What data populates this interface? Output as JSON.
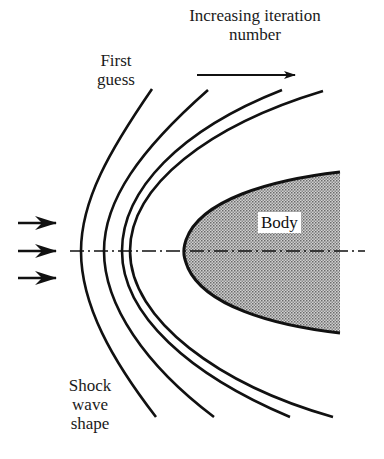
{
  "figure": {
    "labels": {
      "iteration_line1": "Increasing iteration",
      "iteration_line2": "number",
      "first_guess_line1": "First",
      "first_guess_line2": "guess",
      "body": "Body",
      "shock_line1": "Shock",
      "shock_line2": "wave",
      "shock_line3": "shape"
    },
    "elements": {
      "freestream_arrows": 3,
      "shock_iterations": 4,
      "centerline": "dash-dot symmetry axis"
    },
    "colors": {
      "stroke": "#111111",
      "body_fill": "#a8a8a8",
      "background": "#ffffff"
    }
  }
}
